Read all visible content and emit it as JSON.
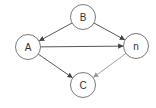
{
  "diagram": {
    "type": "directed-graph",
    "nodes": [
      {
        "id": "B",
        "label": "B",
        "cx": 83,
        "cy": 17,
        "r": 12.5
      },
      {
        "id": "A",
        "label": "A",
        "cx": 28,
        "cy": 47,
        "r": 12.5
      },
      {
        "id": "n",
        "label": "n",
        "cx": 136,
        "cy": 46,
        "r": 12.5
      },
      {
        "id": "C",
        "label": "C",
        "cx": 83,
        "cy": 85,
        "r": 12.5
      }
    ],
    "edges": [
      {
        "from": "B",
        "to": "A",
        "color": "#444444"
      },
      {
        "from": "B",
        "to": "n",
        "color": "#444444"
      },
      {
        "from": "A",
        "to": "n",
        "color": "#444444"
      },
      {
        "from": "A",
        "to": "C",
        "color": "#444444"
      },
      {
        "from": "n",
        "to": "C",
        "color": "#9a9a9a"
      }
    ],
    "colors": {
      "node_stroke": "#7a7a7a",
      "node_fill": "#ffffff",
      "label": "#333333",
      "background": "#ffffff"
    }
  }
}
